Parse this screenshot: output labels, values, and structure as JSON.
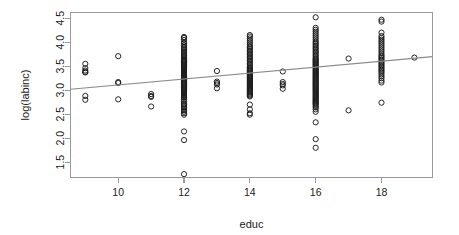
{
  "chart_data": {
    "type": "scatter",
    "title": "",
    "xlabel": "educ",
    "ylabel": "log(labinc)",
    "xlim": [
      8.55,
      19.55
    ],
    "ylim": [
      1.18,
      4.62
    ],
    "xticks": [
      10,
      12,
      14,
      16,
      18
    ],
    "xtick_labels": [
      "10",
      "12",
      "14",
      "16",
      "18"
    ],
    "yticks": [
      1.5,
      2.0,
      2.5,
      3.0,
      3.5,
      4.0,
      4.5
    ],
    "ytick_labels": [
      "1.5",
      "2.0",
      "2.5",
      "3.0",
      "3.5",
      "4.0",
      "4.5"
    ],
    "grid": false,
    "legend": "none",
    "box": true,
    "point_marker": "open-circle",
    "point_radius": 2.6,
    "colors": {
      "point": "#1b1b1b",
      "line": "#8a8a8a",
      "axis": "#9a9a9a",
      "background": "#ffffff",
      "text": "#1b1b1b"
    },
    "fit_line": {
      "type": "linear-regression",
      "x_start": 8.55,
      "y_start": 3.02,
      "x_end": 19.55,
      "y_end": 3.7,
      "slope": 0.0618,
      "intercept": 2.492
    },
    "series": [
      {
        "name": "observations",
        "points": [
          [
            9,
            3.55
          ],
          [
            9,
            3.46
          ],
          [
            9,
            3.41
          ],
          [
            9,
            3.38
          ],
          [
            9,
            3.37
          ],
          [
            9,
            2.88
          ],
          [
            9,
            2.8
          ],
          [
            10,
            3.71
          ],
          [
            10,
            3.17
          ],
          [
            10,
            3.15
          ],
          [
            10,
            2.81
          ],
          [
            11,
            2.92
          ],
          [
            11,
            2.88
          ],
          [
            11,
            2.86
          ],
          [
            11,
            2.66
          ],
          [
            12,
            4.11
          ],
          [
            12,
            4.09
          ],
          [
            12,
            4.05
          ],
          [
            12,
            4.0
          ],
          [
            12,
            3.97
          ],
          [
            12,
            3.93
          ],
          [
            12,
            3.9
          ],
          [
            12,
            3.87
          ],
          [
            12,
            3.84
          ],
          [
            12,
            3.81
          ],
          [
            12,
            3.78
          ],
          [
            12,
            3.76
          ],
          [
            12,
            3.73
          ],
          [
            12,
            3.71
          ],
          [
            12,
            3.69
          ],
          [
            12,
            3.66
          ],
          [
            12,
            3.64
          ],
          [
            12,
            3.62
          ],
          [
            12,
            3.6
          ],
          [
            12,
            3.58
          ],
          [
            12,
            3.56
          ],
          [
            12,
            3.54
          ],
          [
            12,
            3.52
          ],
          [
            12,
            3.5
          ],
          [
            12,
            3.48
          ],
          [
            12,
            3.46
          ],
          [
            12,
            3.44
          ],
          [
            12,
            3.42
          ],
          [
            12,
            3.4
          ],
          [
            12,
            3.38
          ],
          [
            12,
            3.36
          ],
          [
            12,
            3.34
          ],
          [
            12,
            3.32
          ],
          [
            12,
            3.3
          ],
          [
            12,
            3.28
          ],
          [
            12,
            3.26
          ],
          [
            12,
            3.24
          ],
          [
            12,
            3.22
          ],
          [
            12,
            3.2
          ],
          [
            12,
            3.18
          ],
          [
            12,
            3.16
          ],
          [
            12,
            3.14
          ],
          [
            12,
            3.12
          ],
          [
            12,
            3.1
          ],
          [
            12,
            3.08
          ],
          [
            12,
            3.06
          ],
          [
            12,
            3.04
          ],
          [
            12,
            3.02
          ],
          [
            12,
            3.0
          ],
          [
            12,
            2.98
          ],
          [
            12,
            2.96
          ],
          [
            12,
            2.94
          ],
          [
            12,
            2.92
          ],
          [
            12,
            2.9
          ],
          [
            12,
            2.88
          ],
          [
            12,
            2.86
          ],
          [
            12,
            2.84
          ],
          [
            12,
            2.8
          ],
          [
            12,
            2.76
          ],
          [
            12,
            2.72
          ],
          [
            12,
            2.7
          ],
          [
            12,
            2.67
          ],
          [
            12,
            2.64
          ],
          [
            12,
            2.61
          ],
          [
            12,
            2.58
          ],
          [
            12,
            2.55
          ],
          [
            12,
            2.52
          ],
          [
            12,
            2.49
          ],
          [
            12,
            2.14
          ],
          [
            12,
            1.96
          ],
          [
            12,
            1.25
          ],
          [
            13,
            3.4
          ],
          [
            13,
            3.18
          ],
          [
            13,
            3.15
          ],
          [
            13,
            3.12
          ],
          [
            13,
            3.04
          ],
          [
            14,
            4.15
          ],
          [
            14,
            4.12
          ],
          [
            14,
            4.08
          ],
          [
            14,
            4.04
          ],
          [
            14,
            4.0
          ],
          [
            14,
            3.96
          ],
          [
            14,
            3.92
          ],
          [
            14,
            3.89
          ],
          [
            14,
            3.86
          ],
          [
            14,
            3.83
          ],
          [
            14,
            3.8
          ],
          [
            14,
            3.77
          ],
          [
            14,
            3.74
          ],
          [
            14,
            3.71
          ],
          [
            14,
            3.68
          ],
          [
            14,
            3.65
          ],
          [
            14,
            3.62
          ],
          [
            14,
            3.59
          ],
          [
            14,
            3.56
          ],
          [
            14,
            3.53
          ],
          [
            14,
            3.5
          ],
          [
            14,
            3.47
          ],
          [
            14,
            3.45
          ],
          [
            14,
            3.43
          ],
          [
            14,
            3.41
          ],
          [
            14,
            3.39
          ],
          [
            14,
            3.37
          ],
          [
            14,
            3.35
          ],
          [
            14,
            3.33
          ],
          [
            14,
            3.31
          ],
          [
            14,
            3.29
          ],
          [
            14,
            3.27
          ],
          [
            14,
            3.25
          ],
          [
            14,
            3.23
          ],
          [
            14,
            3.21
          ],
          [
            14,
            3.19
          ],
          [
            14,
            3.17
          ],
          [
            14,
            3.15
          ],
          [
            14,
            3.13
          ],
          [
            14,
            3.11
          ],
          [
            14,
            3.09
          ],
          [
            14,
            3.07
          ],
          [
            14,
            3.05
          ],
          [
            14,
            3.03
          ],
          [
            14,
            3.01
          ],
          [
            14,
            2.99
          ],
          [
            14,
            2.97
          ],
          [
            14,
            2.95
          ],
          [
            14,
            2.93
          ],
          [
            14,
            2.91
          ],
          [
            14,
            2.89
          ],
          [
            14,
            2.87
          ],
          [
            14,
            2.7
          ],
          [
            14,
            2.6
          ],
          [
            14,
            2.52
          ],
          [
            14,
            2.49
          ],
          [
            15,
            3.39
          ],
          [
            15,
            3.17
          ],
          [
            15,
            3.13
          ],
          [
            15,
            3.1
          ],
          [
            15,
            3.03
          ],
          [
            16,
            4.52
          ],
          [
            16,
            4.3
          ],
          [
            16,
            4.26
          ],
          [
            16,
            4.22
          ],
          [
            16,
            4.18
          ],
          [
            16,
            4.14
          ],
          [
            16,
            4.1
          ],
          [
            16,
            4.06
          ],
          [
            16,
            4.02
          ],
          [
            16,
            3.99
          ],
          [
            16,
            3.96
          ],
          [
            16,
            3.93
          ],
          [
            16,
            3.9
          ],
          [
            16,
            3.87
          ],
          [
            16,
            3.84
          ],
          [
            16,
            3.81
          ],
          [
            16,
            3.78
          ],
          [
            16,
            3.75
          ],
          [
            16,
            3.72
          ],
          [
            16,
            3.69
          ],
          [
            16,
            3.66
          ],
          [
            16,
            3.64
          ],
          [
            16,
            3.62
          ],
          [
            16,
            3.6
          ],
          [
            16,
            3.58
          ],
          [
            16,
            3.56
          ],
          [
            16,
            3.54
          ],
          [
            16,
            3.52
          ],
          [
            16,
            3.5
          ],
          [
            16,
            3.48
          ],
          [
            16,
            3.46
          ],
          [
            16,
            3.44
          ],
          [
            16,
            3.42
          ],
          [
            16,
            3.4
          ],
          [
            16,
            3.38
          ],
          [
            16,
            3.36
          ],
          [
            16,
            3.34
          ],
          [
            16,
            3.32
          ],
          [
            16,
            3.3
          ],
          [
            16,
            3.28
          ],
          [
            16,
            3.26
          ],
          [
            16,
            3.24
          ],
          [
            16,
            3.22
          ],
          [
            16,
            3.2
          ],
          [
            16,
            3.18
          ],
          [
            16,
            3.16
          ],
          [
            16,
            3.14
          ],
          [
            16,
            3.12
          ],
          [
            16,
            3.1
          ],
          [
            16,
            3.08
          ],
          [
            16,
            3.06
          ],
          [
            16,
            3.04
          ],
          [
            16,
            3.02
          ],
          [
            16,
            3.0
          ],
          [
            16,
            2.98
          ],
          [
            16,
            2.96
          ],
          [
            16,
            2.94
          ],
          [
            16,
            2.92
          ],
          [
            16,
            2.9
          ],
          [
            16,
            2.88
          ],
          [
            16,
            2.86
          ],
          [
            16,
            2.84
          ],
          [
            16,
            2.82
          ],
          [
            16,
            2.8
          ],
          [
            16,
            2.78
          ],
          [
            16,
            2.76
          ],
          [
            16,
            2.74
          ],
          [
            16,
            2.72
          ],
          [
            16,
            2.7
          ],
          [
            16,
            2.67
          ],
          [
            16,
            2.64
          ],
          [
            16,
            2.6
          ],
          [
            16,
            2.55
          ],
          [
            16,
            2.33
          ],
          [
            16,
            1.98
          ],
          [
            16,
            1.8
          ],
          [
            17,
            3.66
          ],
          [
            17,
            2.58
          ],
          [
            18,
            4.47
          ],
          [
            18,
            4.43
          ],
          [
            18,
            4.2
          ],
          [
            18,
            4.13
          ],
          [
            18,
            4.09
          ],
          [
            18,
            4.05
          ],
          [
            18,
            4.01
          ],
          [
            18,
            3.97
          ],
          [
            18,
            3.93
          ],
          [
            18,
            3.89
          ],
          [
            18,
            3.85
          ],
          [
            18,
            3.81
          ],
          [
            18,
            3.77
          ],
          [
            18,
            3.73
          ],
          [
            18,
            3.7
          ],
          [
            18,
            3.67
          ],
          [
            18,
            3.64
          ],
          [
            18,
            3.61
          ],
          [
            18,
            3.58
          ],
          [
            18,
            3.55
          ],
          [
            18,
            3.52
          ],
          [
            18,
            3.49
          ],
          [
            18,
            3.46
          ],
          [
            18,
            3.43
          ],
          [
            18,
            3.4
          ],
          [
            18,
            3.37
          ],
          [
            18,
            3.33
          ],
          [
            18,
            3.29
          ],
          [
            18,
            3.25
          ],
          [
            18,
            3.2
          ],
          [
            18,
            3.16
          ],
          [
            18,
            2.74
          ],
          [
            19,
            3.68
          ]
        ]
      }
    ]
  }
}
